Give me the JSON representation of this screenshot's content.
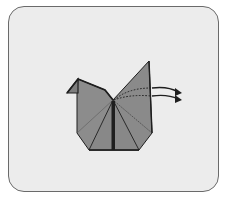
{
  "diagram": {
    "colors": {
      "background": "#ffffff",
      "panel": "#ececec",
      "panel_border": "#6a6a6a",
      "paper": "#8a8a8a",
      "paper_dark": "#7a7a7a",
      "outline": "#1e1e1e"
    },
    "arrows": [
      {
        "direction": "right",
        "style": "fold-arrow"
      },
      {
        "direction": "right",
        "style": "fold-arrow"
      }
    ],
    "crease_lines": [
      {
        "style": "dotted",
        "meaning": "valley-fold"
      },
      {
        "style": "dotted",
        "meaning": "valley-fold"
      },
      {
        "style": "dotted",
        "meaning": "valley-fold"
      }
    ]
  }
}
